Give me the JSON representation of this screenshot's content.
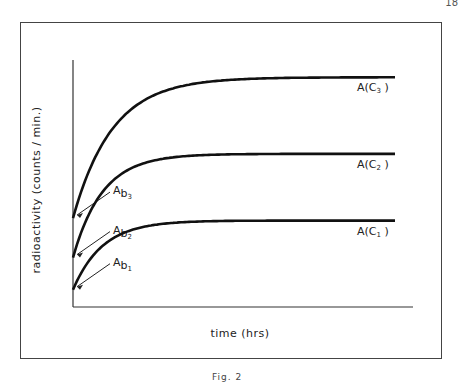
{
  "page_number": "18",
  "figure_caption": "Fig. 2",
  "axes": {
    "ylabel": "radioactivity (counts / min.)",
    "xlabel": "time (hrs)"
  },
  "curves": [
    {
      "id": "c3",
      "label": "A(C",
      "sub": "3",
      "label_close": ")",
      "start_label": "A",
      "start_sub_b": "b",
      "start_sub_n": "3",
      "start_level": 0.36,
      "plateau": 0.93
    },
    {
      "id": "c2",
      "label": "A(C",
      "sub": "2",
      "label_close": ")",
      "start_label": "A",
      "start_sub_b": "b",
      "start_sub_n": "2",
      "start_level": 0.2,
      "plateau": 0.62
    },
    {
      "id": "c1",
      "label": "A(C",
      "sub": "1",
      "label_close": ")",
      "start_label": "A",
      "start_sub_b": "b",
      "start_sub_n": "1",
      "start_level": 0.07,
      "plateau": 0.35
    }
  ],
  "colors": {
    "line": "#111111",
    "frame": "#444444"
  }
}
